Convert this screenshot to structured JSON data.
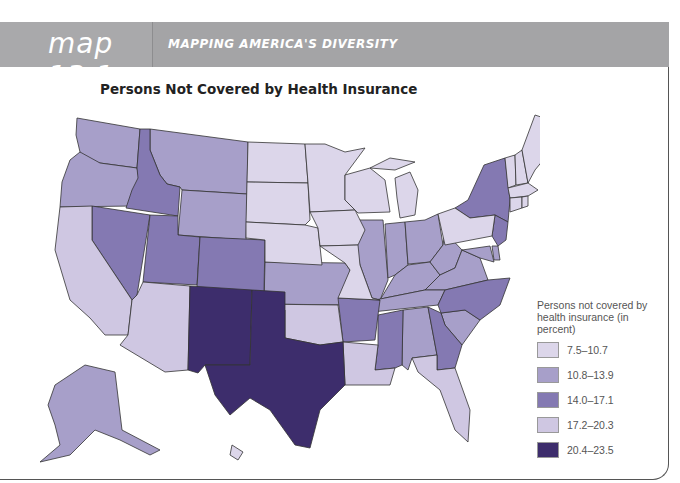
{
  "header": {
    "map_number": "map 13.1",
    "series_title": "MAPPING AMERICA'S DIVERSITY"
  },
  "map": {
    "title": "Persons Not Covered by Health Insurance",
    "colors": {
      "c1": "#dcd6ea",
      "c2": "#a79fc9",
      "c3": "#8479b2",
      "c4": "#cfc7e2",
      "c5": "#3d2d6c"
    },
    "legend": {
      "title": "Persons not covered by health insurance (in percent)",
      "items": [
        {
          "label": "7.5–10.7",
          "color": "#dcd6ea"
        },
        {
          "label": "10.8–13.9",
          "color": "#a79fc9"
        },
        {
          "label": "14.0–17.1",
          "color": "#8479b2"
        },
        {
          "label": "17.2–20.3",
          "color": "#cfc7e2"
        },
        {
          "label": "20.4–23.5",
          "color": "#3d2d6c"
        }
      ]
    },
    "states": {
      "7.5–10.7": [
        "ND",
        "SD",
        "NE",
        "MN",
        "IA",
        "MO",
        "WI",
        "MI",
        "PA",
        "VT",
        "NH",
        "ME",
        "MA",
        "CT",
        "RI",
        "HI"
      ],
      "10.8–13.9": [
        "WA",
        "OR",
        "MT",
        "WY",
        "KS",
        "IL",
        "IN",
        "OH",
        "KY",
        "VA",
        "WV",
        "TN",
        "AL",
        "SC",
        "DE",
        "MD",
        "AK"
      ],
      "14.0–17.1": [
        "ID",
        "NV",
        "UT",
        "CO",
        "NY",
        "NJ",
        "NC",
        "GA",
        "MS",
        "AR"
      ],
      "17.2–20.3": [
        "CA",
        "AZ",
        "OK",
        "LA",
        "FL"
      ],
      "20.4–23.5": [
        "NM",
        "TX"
      ]
    }
  }
}
